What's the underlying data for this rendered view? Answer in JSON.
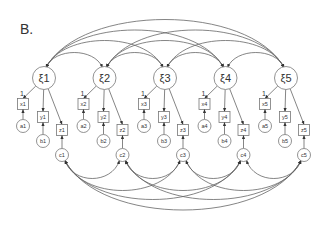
{
  "panel_label": "B.",
  "colors": {
    "line": "#555555",
    "node_stroke": "#777777",
    "text": "#333333",
    "background": "#ffffff"
  },
  "latent_factors": [
    {
      "id": "xi1",
      "label": "ξ1",
      "loading_label": "1"
    },
    {
      "id": "xi2",
      "label": "ξ2",
      "loading_label": "1"
    },
    {
      "id": "xi3",
      "label": "ξ3",
      "loading_label": "1"
    },
    {
      "id": "xi4",
      "label": "ξ4",
      "loading_label": "1"
    },
    {
      "id": "xi5",
      "label": "ξ5",
      "loading_label": "1"
    }
  ],
  "groups": [
    {
      "indicators": [
        "x1",
        "y1",
        "z1"
      ],
      "errors": [
        "a1",
        "b1",
        "c1"
      ]
    },
    {
      "indicators": [
        "x2",
        "y2",
        "z2"
      ],
      "errors": [
        "a2",
        "b2",
        "c2"
      ]
    },
    {
      "indicators": [
        "x3",
        "y3",
        "z3"
      ],
      "errors": [
        "a3",
        "b3",
        "c3"
      ]
    },
    {
      "indicators": [
        "x4",
        "y4",
        "z4"
      ],
      "errors": [
        "a4",
        "b4",
        "c4"
      ]
    },
    {
      "indicators": [
        "x5",
        "y5",
        "z5"
      ],
      "errors": [
        "a5",
        "b5",
        "c5"
      ]
    }
  ],
  "covariances": {
    "latent": "all pairs of ξ1–ξ5 connected by curved double-headed arrows above",
    "errors_c": "all pairs of c1–c5 connected by curved double-headed arrows below"
  }
}
